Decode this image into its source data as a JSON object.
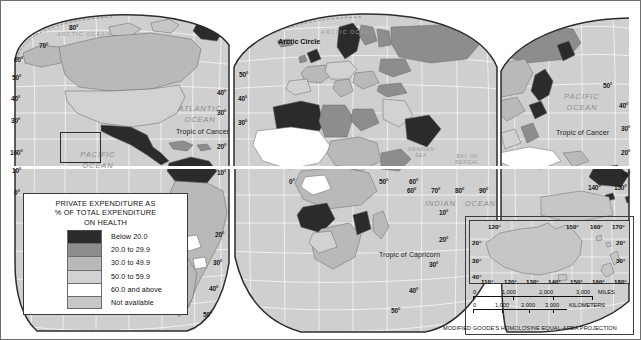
{
  "figure": {
    "kind": "thematic-world-map",
    "projection_note": "MODIFIED GOODE'S HOMOLOSINE EQUAL-AREA PROJECTION"
  },
  "legend": {
    "title_line1": "PRIVATE EXPENDITURE AS",
    "title_line2": "% OF TOTAL EXPENDITURE",
    "title_line3": "ON  HEALTH",
    "classes": [
      {
        "label": "Below 20.0",
        "color": "#2b2b2b"
      },
      {
        "label": "20.0 to 29.9",
        "color": "#8d8d8d"
      },
      {
        "label": "30.0 to 49.9",
        "color": "#b9b9b9"
      },
      {
        "label": "50.0 to 59.9",
        "color": "#d2d2d2"
      },
      {
        "label": "60.0 and above",
        "color": "#ffffff"
      },
      {
        "label": "Not available",
        "color": "#c6c6c6"
      }
    ]
  },
  "ocean_labels": [
    {
      "name": "arctic-ocean-left",
      "text": "ARCTIC OCEAN"
    },
    {
      "name": "arctic-ocean-center",
      "text": "ARCTIC OCEAN"
    },
    {
      "name": "atlantic-ocean",
      "text": "ATLANTIC\nOCEAN"
    },
    {
      "name": "pacific-ocean-left",
      "text": "PACIFIC\nOCEAN"
    },
    {
      "name": "pacific-ocean-right",
      "text": "PACIFIC\nOCEAN"
    },
    {
      "name": "indian-ocean",
      "text": "INDIAN    OCEAN"
    }
  ],
  "sea_labels": [
    {
      "name": "arabian-sea",
      "line1": "ARABIAN",
      "line2": "SEA"
    },
    {
      "name": "bay-of-bengal",
      "line1": "BAY OF",
      "line2": "BENGAL"
    },
    {
      "name": "coral-sea",
      "line1": "CORAL",
      "line2": "SEA"
    }
  ],
  "reference_lines": {
    "arctic_circle": "Arctic Circle",
    "tropic_of_cancer_atlantic": "Tropic of Cancer",
    "tropic_of_cancer_pacific": "Tropic of Cancer",
    "tropic_of_capricorn": "Tropic of Capricorn"
  },
  "graticule_labels": {
    "left_lobe_left_edge": [
      "60°",
      "50°",
      "40°",
      "30°",
      "10°",
      "0°"
    ],
    "left_lobe_top": [
      "80°",
      "70°"
    ],
    "left_lobe_right_edge": [
      "40°",
      "30°",
      "20°",
      "10°",
      "20°",
      "30°",
      "40°",
      "50°"
    ],
    "hawaii_inset": [
      "160°"
    ],
    "center_lobe_left": [
      "50°",
      "40°",
      "30°"
    ],
    "center_lobe_bottom": [
      "0°",
      "50°",
      "60°",
      "70°",
      "80°",
      "90°"
    ],
    "center_lobe_right": [
      "20°",
      "30°",
      "40°",
      "50°"
    ],
    "right_lobe_right": [
      "50°",
      "40°",
      "30°",
      "20°",
      "10°"
    ],
    "right_lobe_lon": [
      "140°",
      "150°"
    ]
  },
  "australia_inset": {
    "lon_top": [
      "120°",
      "150°",
      "160°",
      "170°"
    ],
    "lon_bottom": [
      "110°",
      "120°",
      "130°",
      "140°",
      "150°",
      "160°",
      "180°"
    ],
    "lat_left": [
      "20°",
      "30°",
      "40°"
    ],
    "lat_right": [
      "20°",
      "30°"
    ]
  },
  "scale": {
    "miles": {
      "unit": "MILES",
      "ticks": [
        "0",
        "1,000",
        "2,000",
        "3,000"
      ]
    },
    "kilometers": {
      "unit": "KILOMETERS",
      "ticks": [
        "0",
        "1,000",
        "2,000",
        "3,000"
      ]
    }
  },
  "palette": {
    "ocean": "#cfcfcf",
    "graticule": "#ffffff",
    "outline": "#5a5a5a",
    "frame": "#6f6f6f"
  }
}
